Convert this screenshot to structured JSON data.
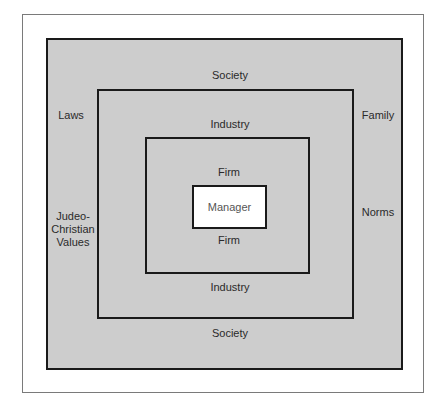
{
  "diagram": {
    "type": "nested-boxes",
    "levels": [
      {
        "name": "Society",
        "top_label": "Society",
        "bottom_label": "Society",
        "side_labels": {
          "left": [
            "Laws",
            "Judeo-Christian Values"
          ],
          "right": [
            "Family",
            "Norms"
          ]
        }
      },
      {
        "name": "Industry",
        "top_label": "Industry",
        "bottom_label": "Industry"
      },
      {
        "name": "Firm",
        "top_label": "Firm",
        "bottom_label": "Firm"
      },
      {
        "name": "Manager",
        "center_label": "Manager"
      }
    ],
    "labels": {
      "society_top": "Society",
      "society_bottom": "Society",
      "industry_top": "Industry",
      "industry_bottom": "Industry",
      "firm_top": "Firm",
      "firm_bottom": "Firm",
      "manager": "Manager",
      "laws": "Laws",
      "judeo_line1": "Judeo-",
      "judeo_line2": "Christian",
      "judeo_line3": "Values",
      "family": "Family",
      "norms": "Norms"
    },
    "colors": {
      "fill": "#cdcdcd",
      "border": "#1a1a1a",
      "manager_fill": "#ffffff"
    }
  }
}
